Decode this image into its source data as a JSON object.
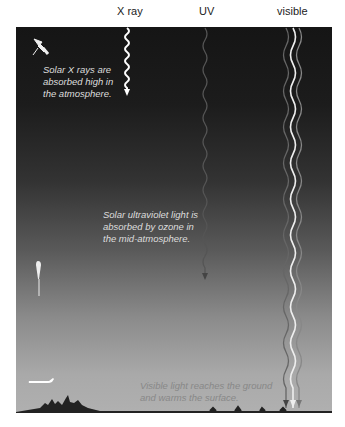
{
  "labels": {
    "xray": "X ray",
    "uv": "UV",
    "visible": "visible"
  },
  "notes": {
    "xray_line1": "Solar X rays are",
    "xray_line2": "absorbed high in",
    "xray_line3": "the atmosphere.",
    "uv_line1": "Solar ultraviolet light is",
    "uv_line2": "absorbed by ozone in",
    "uv_line3": "the mid-atmosphere.",
    "vis_line1": "Visible light reaches the ground",
    "vis_line2": "and warms the surface."
  },
  "colors": {
    "sky_top": "#151515",
    "sky_bottom": "#b0b0b0",
    "xray_wave": "#ffffff",
    "uv_wave": "#555555",
    "visible_wave": "#eeeeee"
  },
  "icons": [
    "satellite-icon",
    "weather-balloon-icon",
    "airplane-icon",
    "city-skyline-icon"
  ]
}
